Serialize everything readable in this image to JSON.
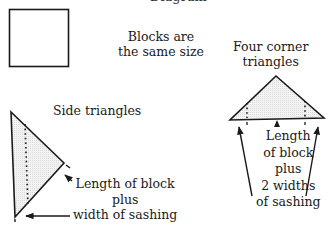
{
  "diagram": {
    "top_heading_fragment": "Diagram",
    "block_label": [
      "Blocks are",
      "the same size"
    ],
    "corner_label": [
      "Four corner",
      "triangles"
    ],
    "side_label": "Side triangles",
    "side_measure": [
      "Length of block",
      "plus",
      "width of sashing"
    ],
    "corner_measure": [
      "Length",
      "of block",
      "plus",
      "2 widths",
      "of sashing"
    ],
    "colors": {
      "line": "#1a1a1a",
      "shade": "#e6e6e6"
    }
  }
}
